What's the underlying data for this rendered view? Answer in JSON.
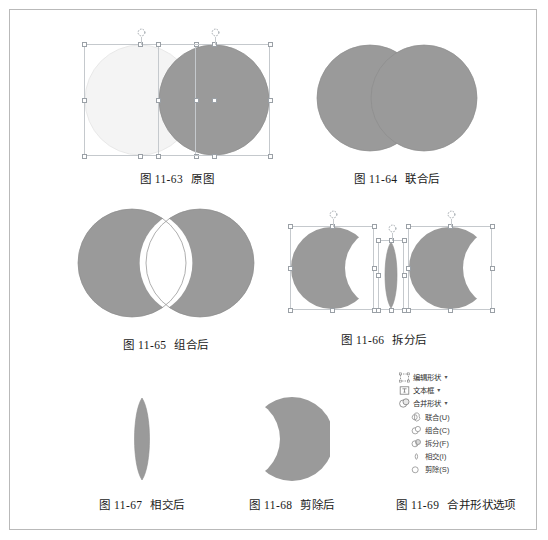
{
  "document": {
    "kind": "textbook-figure-plate",
    "frame_border_color": "#b9b9b9",
    "background": "#ffffff"
  },
  "palette": {
    "shape_fill": "#9a9a9a",
    "shape_fill_light": "#f3f3f3",
    "shape_stroke": "#8d8d8d",
    "selection_border": "#c5c9cd",
    "handle_fill": "#ffffff",
    "handle_stroke": "#9aa0a6",
    "text": "#1a1a1a"
  },
  "figures": [
    {
      "id": "fig-11-63",
      "number": "图 11-63",
      "title": "原图",
      "description": "两个重叠的圆形，均被选中，显示选择框与控制点",
      "selected": true,
      "shape_count": 2
    },
    {
      "id": "fig-11-64",
      "number": "图 11-64",
      "title": "联合后",
      "description": "两圆联合为一个整体图形",
      "selected": false,
      "shape_count": 1
    },
    {
      "id": "fig-11-65",
      "number": "图 11-65",
      "title": "组合后",
      "description": "两圆组合，重叠部分被去除",
      "selected": false,
      "shape_count": 1
    },
    {
      "id": "fig-11-66",
      "number": "图 11-66",
      "title": "拆分后",
      "description": "拆分为三个独立图形，均被选中",
      "selected": true,
      "shape_count": 3
    },
    {
      "id": "fig-11-67",
      "number": "图 11-67",
      "title": "相交后",
      "description": "仅保留两圆的相交部分",
      "selected": false,
      "shape_count": 1
    },
    {
      "id": "fig-11-68",
      "number": "图 11-68",
      "title": "剪除后",
      "description": "从一个圆中剪除另一个圆",
      "selected": false,
      "shape_count": 1
    },
    {
      "id": "fig-11-69",
      "number": "图 11-69",
      "title": "合并形状选项",
      "description": "合并形状下拉菜单",
      "selected": false,
      "shape_count": 0
    }
  ],
  "menu": {
    "top_items": [
      {
        "label": "编辑形状",
        "icon": "edit-shape-icon",
        "caret": "▾"
      },
      {
        "label": "文本框",
        "icon": "text-box-icon",
        "caret": "▾"
      },
      {
        "label": "合并形状",
        "icon": "merge-shapes-icon",
        "caret": "▾"
      }
    ],
    "submenu_items": [
      {
        "label": "联合(U)",
        "icon": "union-icon"
      },
      {
        "label": "组合(C)",
        "icon": "combine-icon"
      },
      {
        "label": "拆分(F)",
        "icon": "fragment-icon"
      },
      {
        "label": "相交(I)",
        "icon": "intersect-icon"
      },
      {
        "label": "剪除(S)",
        "icon": "subtract-icon"
      }
    ]
  }
}
